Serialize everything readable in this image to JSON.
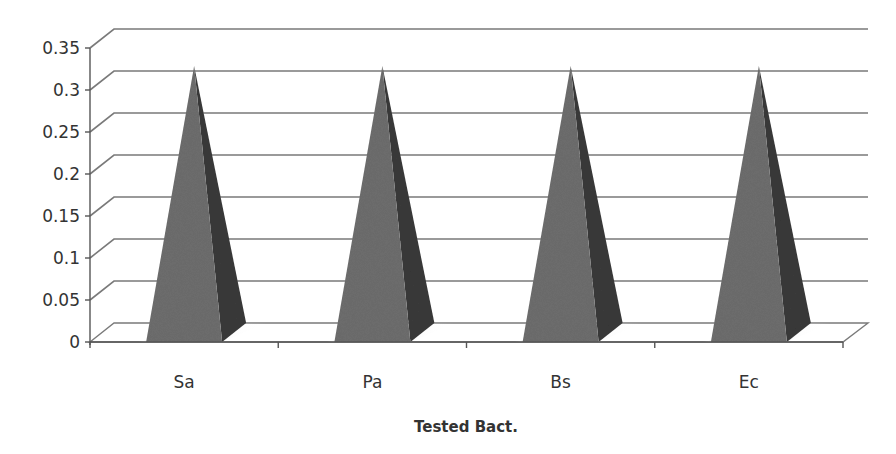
{
  "chart_data": {
    "type": "bar",
    "subtype": "3d-pyramid",
    "title": "",
    "xlabel": "Tested Bact.",
    "ylabel": "",
    "categories": [
      "Sa",
      "Pa",
      "Bs",
      "Ec"
    ],
    "series": [
      {
        "name": "Series 1",
        "values": [
          0.31,
          0.31,
          0.31,
          0.31
        ],
        "color": "#6b6b6b"
      }
    ],
    "ylim": [
      0,
      0.35
    ],
    "yticks": [
      0,
      0.05,
      0.1,
      0.15,
      0.2,
      0.25,
      0.3,
      0.35
    ],
    "ytick_labels": [
      "0",
      "0.05",
      "0.1",
      "0.15",
      "0.2",
      "0.25",
      "0.3",
      "0.35"
    ],
    "grid": true,
    "legend": "none"
  },
  "colors": {
    "pyramid_front": "#6e6e6e",
    "pyramid_side": "#3a3a3a",
    "grid": "#7a7a7a",
    "text": "#333333"
  }
}
